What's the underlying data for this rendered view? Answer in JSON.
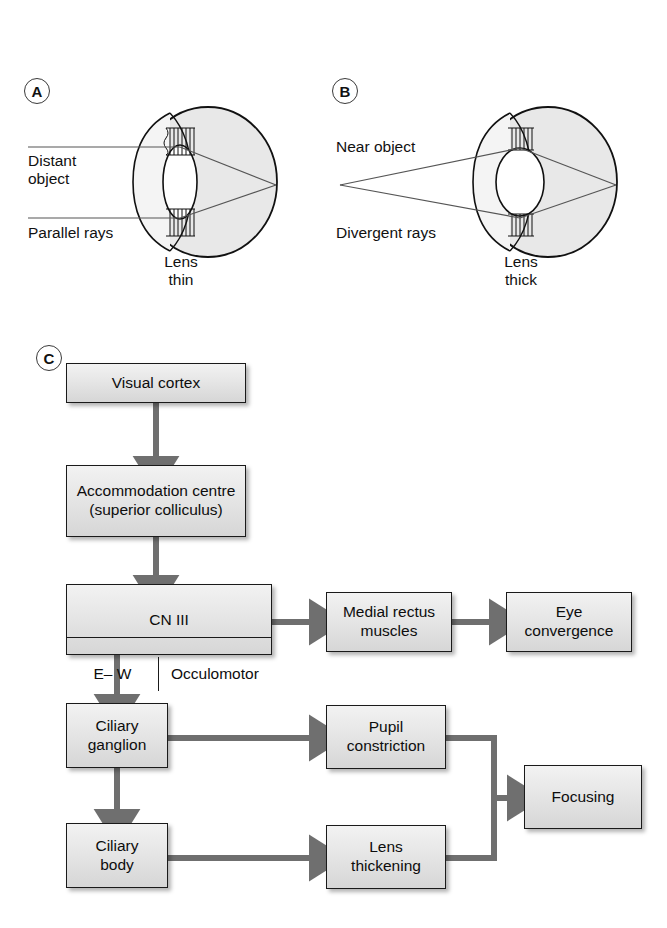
{
  "figure": {
    "panels": [
      {
        "id": "A",
        "letter": "A"
      },
      {
        "id": "B",
        "letter": "B"
      },
      {
        "id": "C",
        "letter": "C"
      }
    ]
  },
  "panel_a": {
    "letter": "A",
    "object_label": "Distant\nobject",
    "rays_label": "Parallel rays",
    "lens_label": "Lens\nthin"
  },
  "panel_b": {
    "letter": "B",
    "object_label": "Near object",
    "rays_label": "Divergent rays",
    "lens_label": "Lens\nthick"
  },
  "panel_c": {
    "letter": "C",
    "boxes": [
      {
        "id": "visual-cortex",
        "label": "Visual cortex"
      },
      {
        "id": "accommodation-centre",
        "label": "Accommodation centre\n(superior colliculus)"
      },
      {
        "id": "cn3",
        "label": "CN III",
        "sub_left": "E– W",
        "sub_right": "Occulomotor"
      },
      {
        "id": "medial-rectus",
        "label": "Medial rectus\nmuscles"
      },
      {
        "id": "eye-convergence",
        "label": "Eye\nconvergence"
      },
      {
        "id": "ciliary-ganglion",
        "label": "Ciliary\nganglion"
      },
      {
        "id": "ciliary-body",
        "label": "Ciliary\nbody"
      },
      {
        "id": "pupil-constriction",
        "label": "Pupil\nconstriction"
      },
      {
        "id": "lens-thickening",
        "label": "Lens\nthickening"
      },
      {
        "id": "focusing",
        "label": "Focusing"
      }
    ]
  },
  "colors": {
    "arrow": "#6f6f6f",
    "box_border": "#1a1a1a",
    "box_fill_top": "#f2f2f2",
    "box_fill_bottom": "#d6d6d6",
    "eye_outline": "#111111",
    "eye_shade": "#e3e3e3",
    "ray": "#555555"
  }
}
